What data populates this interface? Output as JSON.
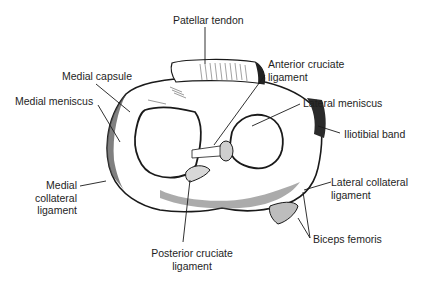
{
  "figure": {
    "labels": [
      {
        "id": "patellar-tendon",
        "lines": [
          "Patellar tendon"
        ]
      },
      {
        "id": "anterior-cruciate-ligament",
        "lines": [
          "Anterior cruciate",
          "ligament"
        ]
      },
      {
        "id": "medial-capsule",
        "lines": [
          "Medial capsule"
        ]
      },
      {
        "id": "medial-meniscus",
        "lines": [
          "Medial meniscus"
        ]
      },
      {
        "id": "lateral-meniscus",
        "lines": [
          "Lateral meniscus"
        ]
      },
      {
        "id": "iliotibial-band",
        "lines": [
          "Iliotibial band"
        ]
      },
      {
        "id": "medial-collateral-ligament",
        "lines": [
          "Medial",
          "collateral",
          "ligament"
        ]
      },
      {
        "id": "lateral-collateral-ligament",
        "lines": [
          "Lateral collateral",
          "ligament"
        ]
      },
      {
        "id": "posterior-cruciate-ligament",
        "lines": [
          "Posterior cruciate",
          "ligament"
        ]
      },
      {
        "id": "biceps-femoris",
        "lines": [
          "Biceps femoris"
        ]
      }
    ]
  },
  "colors": {
    "ink": "#1a1a1a",
    "background": "#ffffff",
    "shade": "#9a9a9a"
  }
}
